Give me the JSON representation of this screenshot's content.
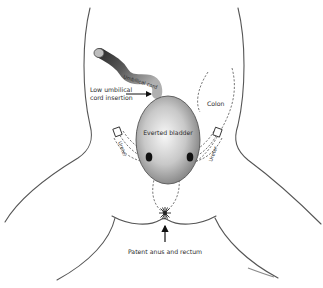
{
  "diagram": {
    "type": "anatomical illustration",
    "labels": {
      "umbilical_cord": "Umbilical cord",
      "low_insertion_line1": "Low umbilical",
      "low_insertion_line2": "cord insertion",
      "colon": "Colon",
      "everted_bladder": "Everted bladder",
      "ureter_left": "Ureter",
      "ureter_right": "Ureter",
      "anus": "Patent anus and rectum"
    },
    "colors": {
      "bladder_fill_center": "#f4f4f4",
      "bladder_fill_edge": "#8a8a8a",
      "cord_dark": "#3a3a3a",
      "cord_light": "#a8a8a8",
      "ureter_orifice": "#111111",
      "outline": "#555555",
      "text": "#2b2b2b"
    }
  }
}
